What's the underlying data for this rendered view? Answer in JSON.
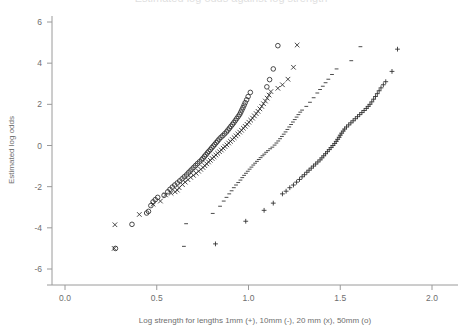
{
  "figure": {
    "background_color": "#ffffff",
    "axis_color": "#9a9a9a",
    "marker_color": "#2b2b2b",
    "title_clipped": "Estimated log odds against log strength"
  },
  "chart_data": {
    "type": "scatter",
    "title": "",
    "xlabel": "Log strength for lengths 1mm (+), 10mm (-), 20 mm (x), 50mm (o)",
    "ylabel": "Estimated log odds",
    "xlim": [
      0.0,
      2.0
    ],
    "ylim": [
      -6,
      6
    ],
    "xticks": [
      0.0,
      0.5,
      1.0,
      1.5,
      2.0
    ],
    "xticklabels": [
      "0.0",
      "0.5",
      "1.0",
      "1.5",
      "2.0"
    ],
    "yticks": [
      6,
      4,
      2,
      0,
      -2,
      -4,
      -6
    ],
    "yticklabels": [
      "6",
      "4",
      "2",
      "0",
      "-2",
      "-4",
      "-6"
    ],
    "grid": false,
    "legend": "in-xlabel",
    "series": [
      {
        "name": "50mm",
        "marker": "o",
        "legend_label": "50mm (o)",
        "points": [
          [
            0.275,
            -5.0
          ],
          [
            0.365,
            -3.83
          ],
          [
            0.445,
            -3.28
          ],
          [
            0.455,
            -3.2
          ],
          [
            0.468,
            -2.92
          ],
          [
            0.48,
            -2.74
          ],
          [
            0.492,
            -2.63
          ],
          [
            0.505,
            -2.52
          ],
          [
            0.54,
            -2.42
          ],
          [
            0.56,
            -2.25
          ],
          [
            0.572,
            -2.13
          ],
          [
            0.585,
            -2.02
          ],
          [
            0.598,
            -1.92
          ],
          [
            0.612,
            -1.82
          ],
          [
            0.625,
            -1.72
          ],
          [
            0.638,
            -1.62
          ],
          [
            0.65,
            -1.52
          ],
          [
            0.662,
            -1.43
          ],
          [
            0.672,
            -1.33
          ],
          [
            0.682,
            -1.24
          ],
          [
            0.692,
            -1.15
          ],
          [
            0.702,
            -1.06
          ],
          [
            0.712,
            -0.97
          ],
          [
            0.722,
            -0.88
          ],
          [
            0.733,
            -0.79
          ],
          [
            0.744,
            -0.7
          ],
          [
            0.752,
            -0.62
          ],
          [
            0.76,
            -0.53
          ],
          [
            0.768,
            -0.45
          ],
          [
            0.776,
            -0.36
          ],
          [
            0.784,
            -0.28
          ],
          [
            0.792,
            -0.2
          ],
          [
            0.8,
            -0.11
          ],
          [
            0.808,
            -0.03
          ],
          [
            0.816,
            0.05
          ],
          [
            0.824,
            0.14
          ],
          [
            0.832,
            0.22
          ],
          [
            0.84,
            0.31
          ],
          [
            0.85,
            0.4
          ],
          [
            0.86,
            0.48
          ],
          [
            0.87,
            0.57
          ],
          [
            0.88,
            0.66
          ],
          [
            0.888,
            0.75
          ],
          [
            0.896,
            0.84
          ],
          [
            0.904,
            0.93
          ],
          [
            0.912,
            1.02
          ],
          [
            0.92,
            1.11
          ],
          [
            0.928,
            1.21
          ],
          [
            0.936,
            1.31
          ],
          [
            0.944,
            1.41
          ],
          [
            0.952,
            1.51
          ],
          [
            0.958,
            1.62
          ],
          [
            0.964,
            1.73
          ],
          [
            0.97,
            1.84
          ],
          [
            0.976,
            1.96
          ],
          [
            0.982,
            2.08
          ],
          [
            0.99,
            2.22
          ],
          [
            0.998,
            2.38
          ],
          [
            1.01,
            2.58
          ],
          [
            1.1,
            2.85
          ],
          [
            1.115,
            3.2
          ],
          [
            1.135,
            3.72
          ],
          [
            1.16,
            4.85
          ]
        ]
      },
      {
        "name": "20mm",
        "marker": "x",
        "legend_label": "20 mm (x)",
        "points": [
          [
            0.268,
            -5.0
          ],
          [
            0.272,
            -3.85
          ],
          [
            0.405,
            -3.35
          ],
          [
            0.48,
            -2.85
          ],
          [
            0.52,
            -2.7
          ],
          [
            0.548,
            -2.4
          ],
          [
            0.578,
            -2.32
          ],
          [
            0.6,
            -2.25
          ],
          [
            0.612,
            -2.17
          ],
          [
            0.622,
            -2.05
          ],
          [
            0.64,
            -1.9
          ],
          [
            0.655,
            -1.78
          ],
          [
            0.67,
            -1.66
          ],
          [
            0.685,
            -1.55
          ],
          [
            0.7,
            -1.45
          ],
          [
            0.715,
            -1.35
          ],
          [
            0.728,
            -1.25
          ],
          [
            0.74,
            -1.16
          ],
          [
            0.752,
            -1.07
          ],
          [
            0.762,
            -0.98
          ],
          [
            0.772,
            -0.89
          ],
          [
            0.782,
            -0.8
          ],
          [
            0.792,
            -0.72
          ],
          [
            0.802,
            -0.63
          ],
          [
            0.812,
            -0.55
          ],
          [
            0.822,
            -0.46
          ],
          [
            0.832,
            -0.38
          ],
          [
            0.842,
            -0.3
          ],
          [
            0.852,
            -0.22
          ],
          [
            0.862,
            -0.13
          ],
          [
            0.872,
            -0.05
          ],
          [
            0.882,
            0.03
          ],
          [
            0.892,
            0.12
          ],
          [
            0.902,
            0.2
          ],
          [
            0.912,
            0.29
          ],
          [
            0.922,
            0.38
          ],
          [
            0.932,
            0.47
          ],
          [
            0.942,
            0.56
          ],
          [
            0.952,
            0.65
          ],
          [
            0.962,
            0.74
          ],
          [
            0.972,
            0.84
          ],
          [
            0.982,
            0.93
          ],
          [
            0.992,
            1.03
          ],
          [
            1.002,
            1.13
          ],
          [
            1.012,
            1.23
          ],
          [
            1.022,
            1.33
          ],
          [
            1.032,
            1.44
          ],
          [
            1.042,
            1.55
          ],
          [
            1.052,
            1.66
          ],
          [
            1.062,
            1.78
          ],
          [
            1.072,
            1.9
          ],
          [
            1.082,
            2.03
          ],
          [
            1.092,
            2.16
          ],
          [
            1.102,
            2.3
          ],
          [
            1.112,
            2.45
          ],
          [
            1.122,
            2.62
          ],
          [
            1.16,
            2.78
          ],
          [
            1.185,
            2.95
          ],
          [
            1.215,
            3.22
          ],
          [
            1.245,
            3.8
          ],
          [
            1.265,
            4.88
          ]
        ]
      },
      {
        "name": "10mm",
        "marker": "-",
        "legend_label": "10mm (-)",
        "points": [
          [
            0.648,
            -4.9
          ],
          [
            0.66,
            -3.8
          ],
          [
            0.805,
            -3.3
          ],
          [
            0.845,
            -2.95
          ],
          [
            0.865,
            -2.7
          ],
          [
            0.88,
            -2.52
          ],
          [
            0.895,
            -2.35
          ],
          [
            0.908,
            -2.2
          ],
          [
            0.92,
            -2.05
          ],
          [
            0.932,
            -1.92
          ],
          [
            0.944,
            -1.8
          ],
          [
            0.956,
            -1.68
          ],
          [
            0.966,
            -1.56
          ],
          [
            0.976,
            -1.45
          ],
          [
            0.986,
            -1.35
          ],
          [
            0.996,
            -1.25
          ],
          [
            1.006,
            -1.15
          ],
          [
            1.016,
            -1.05
          ],
          [
            1.026,
            -0.95
          ],
          [
            1.036,
            -0.86
          ],
          [
            1.046,
            -0.77
          ],
          [
            1.056,
            -0.68
          ],
          [
            1.066,
            -0.59
          ],
          [
            1.076,
            -0.5
          ],
          [
            1.086,
            -0.42
          ],
          [
            1.096,
            -0.33
          ],
          [
            1.106,
            -0.25
          ],
          [
            1.118,
            -0.16
          ],
          [
            1.13,
            -0.08
          ],
          [
            1.142,
            0.02
          ],
          [
            1.152,
            0.12
          ],
          [
            1.162,
            0.22
          ],
          [
            1.172,
            0.33
          ],
          [
            1.182,
            0.44
          ],
          [
            1.192,
            0.55
          ],
          [
            1.202,
            0.66
          ],
          [
            1.212,
            0.78
          ],
          [
            1.222,
            0.9
          ],
          [
            1.232,
            1.02
          ],
          [
            1.242,
            1.14
          ],
          [
            1.252,
            1.26
          ],
          [
            1.262,
            1.38
          ],
          [
            1.272,
            1.5
          ],
          [
            1.282,
            1.62
          ],
          [
            1.292,
            1.72
          ],
          [
            1.315,
            1.9
          ],
          [
            1.335,
            2.1
          ],
          [
            1.355,
            2.32
          ],
          [
            1.375,
            2.55
          ],
          [
            1.39,
            2.72
          ],
          [
            1.405,
            2.88
          ],
          [
            1.42,
            3.05
          ],
          [
            1.435,
            3.22
          ],
          [
            1.455,
            3.45
          ],
          [
            1.48,
            3.72
          ],
          [
            1.56,
            4.12
          ],
          [
            1.61,
            4.8
          ]
        ]
      },
      {
        "name": "1mm",
        "marker": "+",
        "legend_label": "1mm (+)",
        "points": [
          [
            0.82,
            -4.78
          ],
          [
            0.985,
            -3.68
          ],
          [
            1.085,
            -3.15
          ],
          [
            1.135,
            -2.8
          ],
          [
            1.185,
            -2.35
          ],
          [
            1.205,
            -2.22
          ],
          [
            1.225,
            -2.05
          ],
          [
            1.245,
            -1.92
          ],
          [
            1.262,
            -1.78
          ],
          [
            1.278,
            -1.65
          ],
          [
            1.292,
            -1.52
          ],
          [
            1.305,
            -1.42
          ],
          [
            1.318,
            -1.3
          ],
          [
            1.33,
            -1.2
          ],
          [
            1.342,
            -1.1
          ],
          [
            1.354,
            -1.0
          ],
          [
            1.366,
            -0.9
          ],
          [
            1.378,
            -0.8
          ],
          [
            1.39,
            -0.7
          ],
          [
            1.4,
            -0.6
          ],
          [
            1.41,
            -0.5
          ],
          [
            1.42,
            -0.4
          ],
          [
            1.43,
            -0.3
          ],
          [
            1.44,
            -0.2
          ],
          [
            1.45,
            -0.1
          ],
          [
            1.46,
            0.0
          ],
          [
            1.47,
            0.1
          ],
          [
            1.478,
            0.2
          ],
          [
            1.486,
            0.3
          ],
          [
            1.494,
            0.4
          ],
          [
            1.5,
            0.5
          ],
          [
            1.508,
            0.6
          ],
          [
            1.516,
            0.7
          ],
          [
            1.524,
            0.8
          ],
          [
            1.534,
            0.9
          ],
          [
            1.546,
            1.0
          ],
          [
            1.558,
            1.1
          ],
          [
            1.57,
            1.2
          ],
          [
            1.582,
            1.3
          ],
          [
            1.594,
            1.4
          ],
          [
            1.606,
            1.5
          ],
          [
            1.618,
            1.6
          ],
          [
            1.63,
            1.7
          ],
          [
            1.642,
            1.8
          ],
          [
            1.652,
            1.9
          ],
          [
            1.662,
            2.0
          ],
          [
            1.672,
            2.12
          ],
          [
            1.682,
            2.25
          ],
          [
            1.692,
            2.38
          ],
          [
            1.702,
            2.52
          ],
          [
            1.712,
            2.66
          ],
          [
            1.722,
            2.8
          ],
          [
            1.735,
            2.95
          ],
          [
            1.748,
            3.1
          ],
          [
            1.782,
            3.6
          ],
          [
            1.812,
            4.68
          ]
        ]
      }
    ]
  }
}
